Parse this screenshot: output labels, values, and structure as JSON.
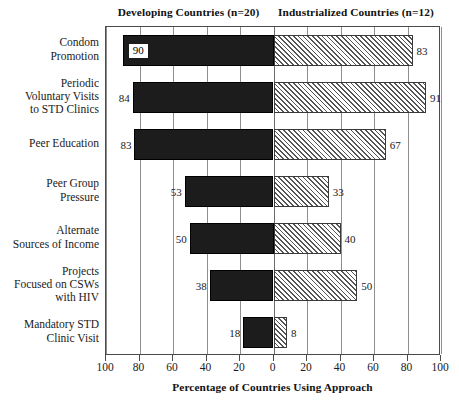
{
  "headers": {
    "left": "Developing Countries (n=20)",
    "right": "Industrialized Countries (n=12)"
  },
  "chart_data": {
    "type": "bar",
    "orientation": "horizontal",
    "style": "diverging-tornado",
    "title": "",
    "xlabel": "Percentage of Countries Using Approach",
    "ylabel": "",
    "grid": true,
    "legend_position": "top-as-column-headers",
    "axis": {
      "left_ticks": [
        100,
        80,
        60,
        40,
        20,
        0
      ],
      "right_ticks": [
        20,
        40,
        60,
        80,
        100
      ],
      "tick_labels": [
        "100",
        "80",
        "60",
        "40",
        "20",
        "0",
        "20",
        "40",
        "60",
        "80",
        "100"
      ],
      "left_range": [
        0,
        100
      ],
      "right_range": [
        0,
        100
      ],
      "units": "percent"
    },
    "categories": [
      "Condom Promotion",
      "Periodic Voluntary Visits to STD Clinics",
      "Peer Education",
      "Peer Group Pressure",
      "Alternate Sources of Income",
      "Projects Focused on CSWs with HIV",
      "Mandatory STD Clinic Visit"
    ],
    "series": [
      {
        "name": "Developing Countries (n=20)",
        "side": "left",
        "fill": "solid-black",
        "values": [
          90,
          84,
          83,
          53,
          50,
          38,
          18
        ]
      },
      {
        "name": "Industrialized Countries (n=12)",
        "side": "right",
        "fill": "diagonal-hatch",
        "values": [
          83,
          91,
          67,
          33,
          40,
          50,
          8
        ]
      }
    ]
  },
  "rows": [
    {
      "label_lines": [
        "Condom",
        "Promotion"
      ],
      "left_value": 90,
      "left_label": "90",
      "left_label_inside": true,
      "right_value": 83,
      "right_label": "83"
    },
    {
      "label_lines": [
        "Periodic",
        "Voluntary Visits",
        "to STD Clinics"
      ],
      "left_value": 84,
      "left_label": "84",
      "left_label_inside": false,
      "right_value": 91,
      "right_label": "91"
    },
    {
      "label_lines": [
        "Peer Education"
      ],
      "left_value": 83,
      "left_label": "83",
      "left_label_inside": false,
      "right_value": 67,
      "right_label": "67"
    },
    {
      "label_lines": [
        "Peer Group",
        "Pressure"
      ],
      "left_value": 53,
      "left_label": "53",
      "left_label_inside": false,
      "right_value": 33,
      "right_label": "33"
    },
    {
      "label_lines": [
        "Alternate",
        "Sources of Income"
      ],
      "left_value": 50,
      "left_label": "50",
      "left_label_inside": false,
      "right_value": 40,
      "right_label": "40"
    },
    {
      "label_lines": [
        "Projects",
        "Focused on CSWs",
        "with HIV"
      ],
      "left_value": 38,
      "left_label": "38",
      "left_label_inside": false,
      "right_value": 50,
      "right_label": "50"
    },
    {
      "label_lines": [
        "Mandatory STD",
        "Clinic Visit"
      ],
      "left_value": 18,
      "left_label": "18",
      "left_label_inside": false,
      "right_value": 8,
      "right_label": "8"
    }
  ],
  "xaxis": {
    "tick_labels": [
      "100",
      "80",
      "60",
      "40",
      "20",
      "0",
      "20",
      "40",
      "60",
      "80",
      "100"
    ],
    "title": "Percentage of Countries Using Approach"
  },
  "colors": {
    "left_bar": "#1c1c1c",
    "right_bar_hatch": "#555555",
    "frame": "#4a4a4a",
    "grid": "#8e8e8e",
    "text": "#1a1a1a"
  }
}
